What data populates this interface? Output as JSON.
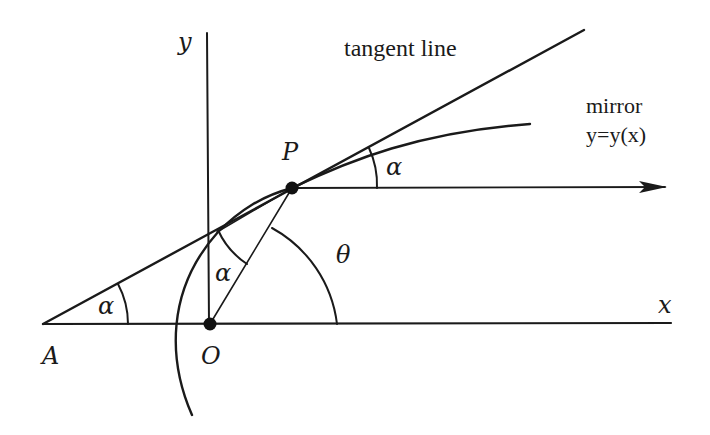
{
  "diagram": {
    "colors": {
      "stroke": "#1a1a1a",
      "background": "#ffffff"
    },
    "labels": {
      "y_axis": "y",
      "x_axis": "x",
      "tangent": "tangent line",
      "mirror_line1": "mirror",
      "mirror_line2": "y=y(x)",
      "point_P": "P",
      "point_O": "O",
      "point_A": "A",
      "alpha_at_P": "α",
      "alpha_at_A": "α",
      "alpha_at_O": "α",
      "theta": "θ"
    },
    "points": {
      "A": [
        43,
        324
      ],
      "O": [
        210,
        324
      ],
      "P": [
        292,
        188
      ]
    },
    "elements": [
      "y-axis (vertical through O)",
      "x-axis (horizontal through A and O)",
      "tangent line through A and P",
      "mirror curve y=y(x) passing through P",
      "ray from P parallel to x-axis (arrow)",
      "segment O to P",
      "angle arc alpha at A",
      "angle arc alpha at P between tangent and ray",
      "angle arc alpha between OP and the perpendicular",
      "angle arc theta at O"
    ]
  }
}
